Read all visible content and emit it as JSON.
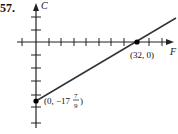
{
  "problem_number": "57.",
  "axes": {
    "x_label": "F",
    "y_label": "C"
  },
  "points": [
    {
      "label": "(32, 0)",
      "x": 32,
      "y": 0
    },
    {
      "label_prefix": "(0, −17",
      "frac_num": "7",
      "frac_den": "9",
      "label_suffix": ")",
      "x": 0,
      "y": -17.78
    }
  ],
  "line": {
    "slope": "5/9",
    "intercept": "-17 7/9",
    "color": "#333333"
  }
}
